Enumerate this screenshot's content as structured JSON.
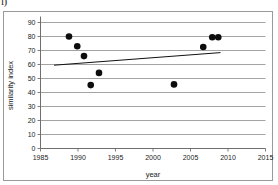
{
  "figure": {
    "corner_glyph": "l)",
    "background_color": "#ffffff",
    "frame_color": "#9a9a9a"
  },
  "chart_data": {
    "type": "scatter",
    "title": "",
    "subtitle": "",
    "xlabel": "year",
    "ylabel": "similarity index",
    "xlim": [
      1985,
      2015
    ],
    "ylim": [
      0,
      90
    ],
    "xticks": [
      1985,
      1990,
      1995,
      2000,
      2005,
      2010,
      2015
    ],
    "xtick_labels": [
      "1985",
      "1990",
      "1995",
      "2000",
      "2005",
      "2010",
      "2015"
    ],
    "yticks": [
      0,
      10,
      20,
      30,
      40,
      50,
      60,
      70,
      80,
      90
    ],
    "ytick_labels": [
      "0",
      "10",
      "20",
      "30",
      "40",
      "50",
      "60",
      "70",
      "80",
      "90"
    ],
    "grid": "horizontal",
    "legend": "none",
    "marker": "filled-circle",
    "marker_color": "#0d0d0d",
    "gridline_color": "#8c8c8c",
    "points": [
      {
        "x": 1988.8,
        "y": 80.0
      },
      {
        "x": 1989.9,
        "y": 73.0
      },
      {
        "x": 1990.8,
        "y": 66.0
      },
      {
        "x": 1991.7,
        "y": 45.3
      },
      {
        "x": 1992.8,
        "y": 54.0
      },
      {
        "x": 2002.8,
        "y": 45.8
      },
      {
        "x": 2006.7,
        "y": 72.5
      },
      {
        "x": 2007.9,
        "y": 79.5
      },
      {
        "x": 2008.7,
        "y": 79.5
      }
    ],
    "trendline": {
      "type": "linear",
      "color": "#111111",
      "x_start": 1986.8,
      "y_start": 59.5,
      "x_end": 2009.0,
      "y_end": 68.5
    }
  }
}
